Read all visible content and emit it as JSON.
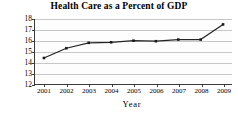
{
  "chart_data": {
    "type": "line",
    "title": "Health Care as a Percent of GDP",
    "xlabel": "Year",
    "ylabel": "Percentage",
    "categories": [
      "2001",
      "2002",
      "2003",
      "2004",
      "2005",
      "2006",
      "2007",
      "2008",
      "2009"
    ],
    "x": [
      2001,
      2002,
      2003,
      2004,
      2005,
      2006,
      2007,
      2008,
      2009
    ],
    "values": [
      14.4,
      15.3,
      15.8,
      15.85,
      16.0,
      15.95,
      16.1,
      16.1,
      17.5
    ],
    "series": [
      {
        "name": "Health care spending",
        "values": [
          14.4,
          15.3,
          15.8,
          15.85,
          16.0,
          15.95,
          16.1,
          16.1,
          17.5
        ]
      }
    ],
    "ylim": [
      12,
      18
    ],
    "yticks": [
      12,
      13,
      14,
      15,
      16,
      17,
      18
    ],
    "ytick_labels": [
      "12",
      "13",
      "14",
      "15",
      "16",
      "17",
      "18"
    ],
    "xlim": [
      2000.6,
      2009.4
    ],
    "grid": "horizontal",
    "legend": "none",
    "marker": "filled-square",
    "line_color": "#262626",
    "grid_color": "#c8c8c8",
    "axis_color": "#3a3a3a",
    "background": "#ffffff"
  }
}
